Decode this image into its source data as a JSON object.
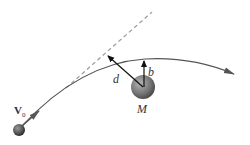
{
  "diagram": {
    "labels": {
      "velocity": "V",
      "velocity_subscript": "0",
      "distance": "d",
      "impact_parameter": "b",
      "mass": "M"
    },
    "colors": {
      "curve": "#555555",
      "dashed_line": "#999999",
      "arrow": "#111111",
      "ball_dark": "#3a3a3a",
      "ball_light": "#9a9a9a"
    }
  }
}
